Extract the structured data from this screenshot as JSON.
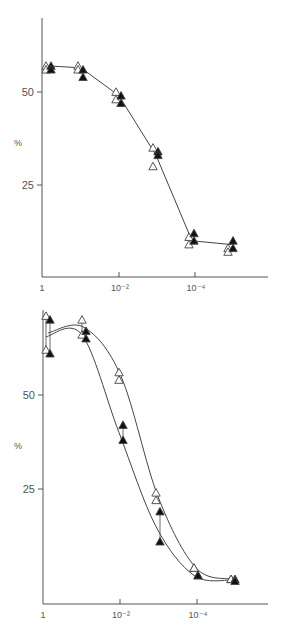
{
  "chart_data": [
    {
      "type": "line",
      "title": "",
      "xlabel": "",
      "ylabel": "%",
      "xscale": "log (decreasing)",
      "x_tick_labels": [
        "1",
        "10⁻²",
        "10⁻⁴"
      ],
      "y_tick_labels": [
        "25",
        "50"
      ],
      "ylim": [
        0,
        70
      ],
      "grid": false,
      "legend": null,
      "x": [
        1,
        0.1,
        0.01,
        0.001,
        0.0001,
        1e-05
      ],
      "series": [
        {
          "name": "open triangles",
          "marker": "open-triangle",
          "values": [
            57,
            57,
            50,
            35,
            9,
            8
          ],
          "values_alt": [
            56,
            56,
            48,
            30,
            11,
            7
          ]
        },
        {
          "name": "filled triangles",
          "marker": "filled-triangle",
          "values": [
            57,
            56,
            49,
            34,
            12,
            10
          ],
          "values_alt": [
            56,
            54,
            47,
            33,
            10,
            8
          ]
        },
        {
          "name": "fitted line",
          "marker": "none",
          "values": [
            57,
            56.5,
            49,
            33,
            10,
            9
          ]
        }
      ]
    },
    {
      "type": "line",
      "title": "",
      "xlabel": "",
      "ylabel": "%",
      "xscale": "log (decreasing)",
      "x_tick_labels": [
        "1",
        "10⁻²",
        "10⁻⁴"
      ],
      "y_tick_labels": [
        "25",
        "50"
      ],
      "ylim": [
        0,
        75
      ],
      "grid": false,
      "legend": null,
      "x": [
        1,
        0.1,
        0.01,
        0.001,
        0.0001,
        1e-05
      ],
      "series": [
        {
          "name": "open triangles",
          "marker": "open-triangle",
          "values": [
            71,
            70,
            56,
            24,
            4,
            1
          ],
          "values_alt": [
            62,
            66,
            54,
            22,
            4,
            1
          ]
        },
        {
          "name": "filled triangles",
          "marker": "filled-triangle",
          "values": [
            70,
            67,
            42,
            19,
            2,
            1
          ],
          "values_alt": [
            61,
            65,
            38,
            11,
            2,
            0.5
          ]
        }
      ]
    }
  ],
  "panels": {
    "top": {
      "ylabel": "%",
      "y50": "50",
      "y25": "25",
      "x1": "1",
      "x2": "10⁻²",
      "x4": "10⁻⁴"
    },
    "bottom": {
      "ylabel": "%",
      "y50": "50",
      "y25": "25",
      "x1": "1",
      "x2": "10⁻²",
      "x4": "10⁻⁴"
    }
  },
  "colors": {
    "axis": "#555555",
    "line": "#444444",
    "marker_fill": "#111111",
    "background": "#ffffff"
  }
}
